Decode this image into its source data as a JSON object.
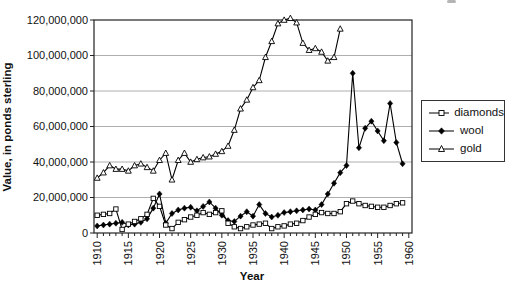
{
  "chart_data": {
    "type": "line",
    "title": "",
    "xlabel": "Year",
    "ylabel": "Value, in ponds sterling",
    "x_min": 1910,
    "x_max": 1960,
    "x_tick_step_major": 5,
    "x_tick_step_minor": 1,
    "y_min_millions": 0,
    "y_max_millions": 120,
    "grid": "horizontal",
    "legend_position": "right",
    "yticks": [
      {
        "millions": 0,
        "label": "0"
      },
      {
        "millions": 20,
        "label": "20,000,000"
      },
      {
        "millions": 40,
        "label": "40,000,000"
      },
      {
        "millions": 60,
        "label": "60,000,000"
      },
      {
        "millions": 80,
        "label": "80,000,000"
      },
      {
        "millions": 100,
        "label": "100,000,000"
      },
      {
        "millions": 120,
        "label": "120,000,000"
      }
    ],
    "series": [
      {
        "name": "diamonds",
        "marker": "open-square",
        "color": "#000000",
        "x_start": 1910,
        "values_in_millions": [
          10,
          10.5,
          11,
          13.5,
          2,
          5,
          6.5,
          8,
          10.5,
          19.5,
          15,
          4.5,
          2.5,
          6,
          7.5,
          9,
          10,
          11.5,
          10.5,
          11.5,
          12.5,
          5.5,
          3.5,
          2.5,
          3.5,
          4.5,
          5,
          5.5,
          2.5,
          3.5,
          4,
          5,
          5.5,
          7,
          9,
          10.5,
          11.5,
          11,
          11,
          12,
          16.5,
          18,
          16.5,
          15.5,
          15,
          14.5,
          14.5,
          15.5,
          16.5,
          17
        ]
      },
      {
        "name": "wool",
        "marker": "filled-diamond",
        "color": "#000000",
        "x_start": 1910,
        "values_in_millions": [
          4,
          4.5,
          5,
          5.5,
          6,
          4.5,
          5,
          6,
          8,
          14,
          22,
          5.5,
          11,
          13,
          14,
          14.5,
          12.5,
          15,
          17.5,
          14,
          10,
          7,
          6.5,
          9.5,
          12,
          9.5,
          16,
          11,
          9,
          10,
          11.5,
          12,
          12.5,
          13,
          13.5,
          13,
          16,
          22,
          28,
          34,
          38,
          90,
          48,
          59,
          63,
          57.5,
          52,
          73,
          51,
          39
        ]
      },
      {
        "name": "gold",
        "marker": "open-triangle",
        "color": "#000000",
        "x_start": 1910,
        "values_in_millions": [
          31,
          34,
          38,
          36,
          36,
          35,
          38,
          39,
          37,
          35,
          41,
          45,
          30,
          41,
          45,
          40,
          41.5,
          42.5,
          43,
          44.5,
          46,
          49,
          58,
          70,
          75,
          82,
          86,
          99,
          108,
          118,
          120,
          121,
          118.5,
          107,
          103,
          104,
          102,
          97,
          99,
          115
        ]
      }
    ]
  },
  "legend": {
    "items": [
      {
        "label": "diamonds",
        "marker": "open-square"
      },
      {
        "label": "wool",
        "marker": "filled-diamond"
      },
      {
        "label": "gold",
        "marker": "open-triangle"
      }
    ]
  }
}
